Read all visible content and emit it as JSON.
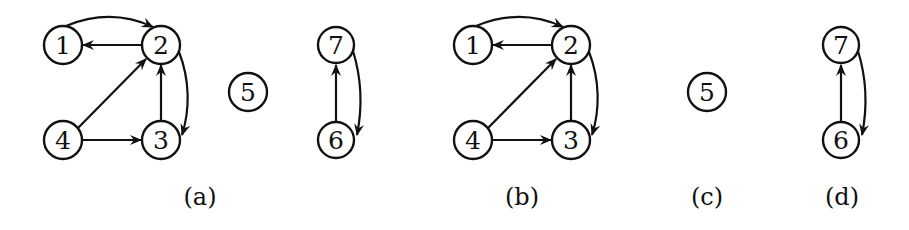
{
  "figure": {
    "panels": [
      {
        "id": "a",
        "caption": "(a)",
        "nodes": [
          {
            "label": "1",
            "x": 63,
            "y": 45
          },
          {
            "label": "2",
            "x": 161,
            "y": 45
          },
          {
            "label": "3",
            "x": 161,
            "y": 140
          },
          {
            "label": "4",
            "x": 63,
            "y": 140
          },
          {
            "label": "5",
            "x": 248,
            "y": 92
          },
          {
            "label": "6",
            "x": 336,
            "y": 140
          },
          {
            "label": "7",
            "x": 336,
            "y": 45
          }
        ],
        "edges": [
          {
            "from": "1",
            "to": "2",
            "style": "curved-over"
          },
          {
            "from": "2",
            "to": "1",
            "style": "straight"
          },
          {
            "from": "2",
            "to": "3",
            "style": "curved-right"
          },
          {
            "from": "3",
            "to": "2",
            "style": "straight"
          },
          {
            "from": "4",
            "to": "2",
            "style": "straight"
          },
          {
            "from": "4",
            "to": "3",
            "style": "straight"
          },
          {
            "from": "6",
            "to": "7",
            "style": "straight"
          },
          {
            "from": "7",
            "to": "6",
            "style": "curved-right"
          }
        ]
      },
      {
        "id": "b",
        "caption": "(b)",
        "nodes": [
          {
            "label": "1",
            "x": 473,
            "y": 45
          },
          {
            "label": "2",
            "x": 571,
            "y": 45
          },
          {
            "label": "3",
            "x": 571,
            "y": 140
          },
          {
            "label": "4",
            "x": 473,
            "y": 140
          }
        ],
        "edges": [
          {
            "from": "1",
            "to": "2",
            "style": "curved-over"
          },
          {
            "from": "2",
            "to": "1",
            "style": "straight"
          },
          {
            "from": "2",
            "to": "3",
            "style": "curved-right"
          },
          {
            "from": "3",
            "to": "2",
            "style": "straight"
          },
          {
            "from": "4",
            "to": "2",
            "style": "straight"
          },
          {
            "from": "4",
            "to": "3",
            "style": "straight"
          }
        ]
      },
      {
        "id": "c",
        "caption": "(c)",
        "nodes": [
          {
            "label": "5",
            "x": 707,
            "y": 92
          }
        ],
        "edges": []
      },
      {
        "id": "d",
        "caption": "(d)",
        "nodes": [
          {
            "label": "6",
            "x": 841,
            "y": 140
          },
          {
            "label": "7",
            "x": 841,
            "y": 45
          }
        ],
        "edges": [
          {
            "from": "6",
            "to": "7",
            "style": "straight"
          },
          {
            "from": "7",
            "to": "6",
            "style": "curved-right"
          }
        ]
      }
    ],
    "captions": {
      "a": "(a)",
      "b": "(b)",
      "c": "(c)",
      "d": "(d)"
    },
    "node_labels": {
      "n1": "1",
      "n2": "2",
      "n3": "3",
      "n4": "4",
      "n5": "5",
      "n6": "6",
      "n7": "7"
    }
  }
}
